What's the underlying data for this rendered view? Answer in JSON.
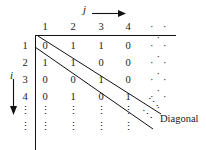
{
  "figure": {
    "type": "cantor-diagonal-matrix",
    "column_axis_label": "j",
    "row_axis_label": "i",
    "column_headers": [
      "1",
      "2",
      "3",
      "4"
    ],
    "row_headers": [
      "1",
      "2",
      "3",
      "4"
    ],
    "horizontal_ellipsis": "· · ·",
    "vertical_ellipsis": "⋮",
    "diagonal_ellipsis": "⋱",
    "rows": [
      {
        "label": "1",
        "values": [
          "0",
          "1",
          "1",
          "0"
        ],
        "tail": "· · ·"
      },
      {
        "label": "2",
        "values": [
          "1",
          "1",
          "0",
          "0"
        ],
        "tail": "· · ·"
      },
      {
        "label": "3",
        "values": [
          "0",
          "0",
          "1",
          "0"
        ],
        "tail": "· · ·"
      },
      {
        "label": "4",
        "values": [
          "0",
          "1",
          "0",
          "1"
        ],
        "tail": "· · ·"
      }
    ],
    "caption": "Diagonal",
    "colors": {
      "ink": "#111111",
      "background": "#ffffff"
    }
  }
}
